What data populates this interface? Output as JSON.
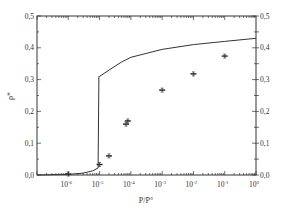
{
  "chart_data": {
    "type": "scatter",
    "title": "",
    "xlabel": "P/P°",
    "ylabel": "ρ*",
    "xscale": "log",
    "xlim": [
      1e-07,
      1
    ],
    "ylim": [
      0.0,
      0.5
    ],
    "x_tick_labels": [
      "10^-6",
      "10^-5",
      "10^-4",
      "10^-3",
      "10^-2",
      "10^-1",
      "10^0"
    ],
    "y_tick_labels_left": [
      "0,0",
      "0,1",
      "0,2",
      "0,3",
      "0,4",
      "0,5"
    ],
    "y_tick_labels_right": [
      "0,0",
      "0,1",
      "0,2",
      "0,3",
      "0,4",
      "0,5"
    ],
    "grid": false,
    "legend": null,
    "series": [
      {
        "name": "experimental",
        "kind": "points_with_error_bars",
        "x": [
          1e-06,
          1e-05,
          2e-05,
          7e-05,
          8e-05,
          0.001,
          0.01,
          0.1
        ],
        "y": [
          0.003,
          0.033,
          0.06,
          0.16,
          0.17,
          0.267,
          0.318,
          0.374
        ]
      },
      {
        "name": "model",
        "kind": "line",
        "x": [
          1e-07,
          1e-06,
          3e-06,
          6e-06,
          9e-06,
          9.5e-06,
          1e-05,
          2e-05,
          5e-05,
          0.0001,
          0.001,
          0.01,
          0.1,
          1
        ],
        "y": [
          0.0,
          0.002,
          0.006,
          0.013,
          0.022,
          0.31,
          0.31,
          0.33,
          0.355,
          0.37,
          0.395,
          0.41,
          0.42,
          0.43
        ]
      }
    ]
  }
}
